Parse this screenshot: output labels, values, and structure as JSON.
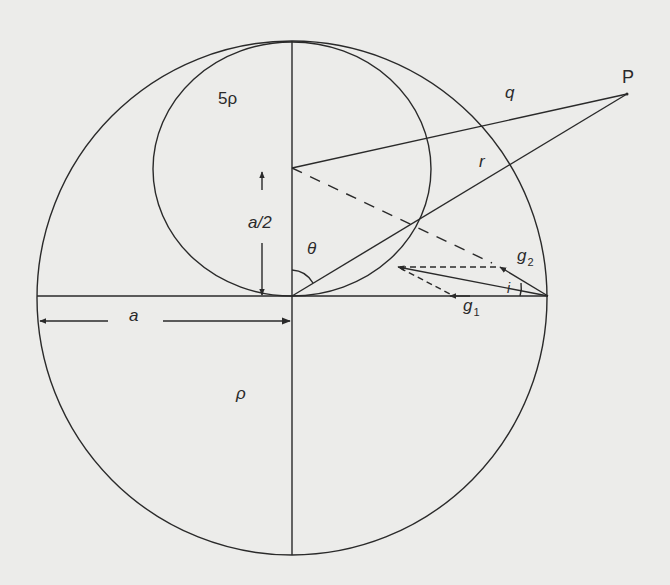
{
  "diagram": {
    "type": "geometry-figure",
    "colors": {
      "background": "#ececea",
      "stroke": "#2a2a2a"
    },
    "labels": {
      "inner_density": "5ρ",
      "outer_density": "ρ",
      "point": "P",
      "q": "q",
      "r": "r",
      "theta": "θ",
      "half_radius": "a/2",
      "radius": "a",
      "g1_base": "g",
      "g1_sub": "1",
      "g2_base": "g",
      "g2_sub": "2",
      "angle_i": "i"
    },
    "geometry": {
      "outer_circle": {
        "cx": 292,
        "cy": 298,
        "rx": 255,
        "ry": 256
      },
      "inner_circle": {
        "cx": 292,
        "cy": 169,
        "rx": 139,
        "ry": 127
      },
      "origin": [
        292,
        296
      ],
      "inner_center": [
        292,
        168
      ],
      "point_P": [
        627,
        93
      ],
      "surface_point": [
        548,
        296
      ]
    }
  }
}
